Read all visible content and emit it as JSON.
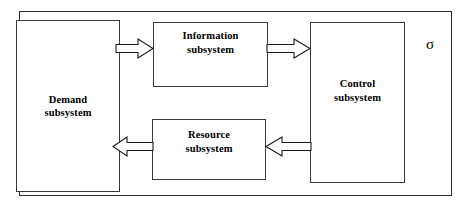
{
  "diagram": {
    "boundary": {
      "name": "system-boundary",
      "annotation": "σ"
    },
    "blocks": [
      {
        "id": "demand",
        "label": "Demand\nsubsystem"
      },
      {
        "id": "information",
        "label": "Information\nsubsystem"
      },
      {
        "id": "control",
        "label": "Control\nsubsystem"
      },
      {
        "id": "resource",
        "label": "Resource\nsubsystem"
      }
    ],
    "arrows": [
      {
        "id": "demand-to-information",
        "from": "Demand subsystem",
        "to": "Information subsystem",
        "direction": "right",
        "style": "hollow-block-arrow"
      },
      {
        "id": "information-to-control",
        "from": "Information subsystem",
        "to": "Control subsystem",
        "direction": "right",
        "style": "hollow-block-arrow"
      },
      {
        "id": "control-to-resource",
        "from": "Control subsystem",
        "to": "Resource subsystem",
        "direction": "left",
        "style": "hollow-block-arrow"
      },
      {
        "id": "resource-to-demand",
        "from": "Resource subsystem",
        "to": "Demand subsystem",
        "direction": "left",
        "style": "hollow-block-arrow"
      }
    ],
    "colors": {
      "background": "#ffffff",
      "box_stroke": "#3a3a3a",
      "boundary_stroke": "#2b2b2b",
      "arrow_stroke": "#1a1a1a",
      "text": "#000000"
    }
  }
}
